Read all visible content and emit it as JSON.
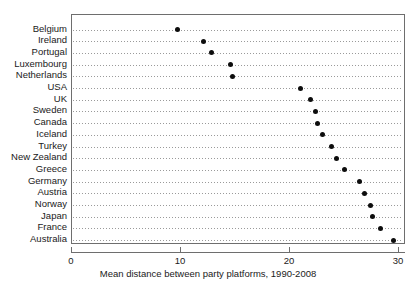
{
  "chart_data": {
    "type": "scatter",
    "title": "",
    "subtitle": "",
    "xlabel": "Mean distance between party platforms, 1990-2008",
    "ylabel": "",
    "xlim": [
      0,
      30
    ],
    "xticks": [
      0,
      10,
      20,
      30
    ],
    "xticklabels": [
      "0",
      "10",
      "20",
      "30"
    ],
    "grid": "horizontal-dotted",
    "legend": "none",
    "orientation": "horizontal-dot-plot",
    "categories": [
      "Belgium",
      "Ireland",
      "Portugal",
      "Luxembourg",
      "Netherlands",
      "USA",
      "UK",
      "Sweden",
      "Canada",
      "Iceland",
      "Turkey",
      "New Zealand",
      "Greece",
      "Germany",
      "Austria",
      "Norway",
      "Japan",
      "France",
      "Australia"
    ],
    "values": [
      9.7,
      12.1,
      12.8,
      14.5,
      14.7,
      21.0,
      21.9,
      22.3,
      22.5,
      23.0,
      23.8,
      24.3,
      25.0,
      26.4,
      26.8,
      27.4,
      27.6,
      28.3,
      29.5
    ],
    "marker_color": "#0d0d0d",
    "axis_color": "#6e6e6e",
    "gridline_color": "#9a9a9a"
  }
}
